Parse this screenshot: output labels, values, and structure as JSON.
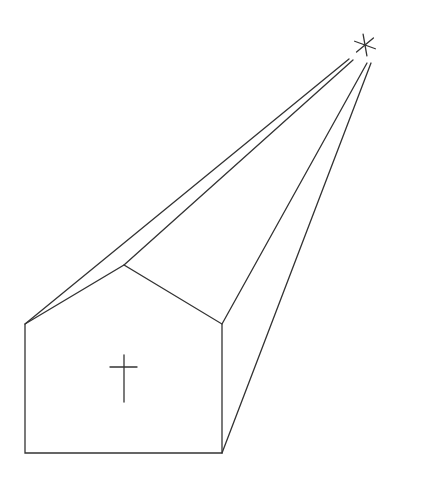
{
  "figure": {
    "stroke_color": "#333333",
    "background": "#ffffff"
  },
  "shapes": {
    "front_face": "25,324 124,265 222,324 222,453 25,453",
    "roof_left_edge": {
      "x1": 25,
      "y1": 324,
      "x2": 349,
      "y2": 59
    },
    "roof_ridge": {
      "x1": 124,
      "y1": 265,
      "x2": 353,
      "y2": 60
    },
    "roof_right_edge": {
      "x1": 222,
      "y1": 324,
      "x2": 367,
      "y2": 63
    },
    "base_right_edge": {
      "x1": 222,
      "y1": 453,
      "x2": 371,
      "y2": 63
    },
    "left_eave_inner": {
      "x1": 25,
      "y1": 324,
      "x2": 124,
      "y2": 265
    },
    "cross_vertical": {
      "x1": 124,
      "y1": 355,
      "x2": 124,
      "y2": 402
    },
    "cross_horizontal": {
      "x1": 110,
      "y1": 367,
      "x2": 137,
      "y2": 367
    },
    "star": {
      "cx": 365,
      "cy": 45,
      "r": 11
    }
  },
  "icons": [
    "star-icon",
    "cross-icon"
  ]
}
